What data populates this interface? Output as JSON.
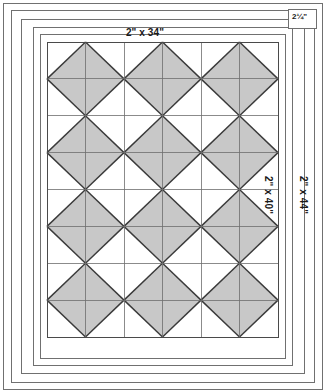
{
  "diagram": {
    "type": "quilt-block-layout",
    "canvas": {
      "width": 325,
      "height": 392
    },
    "colors": {
      "background": "#ffffff",
      "triangle_fill": "#c8c8c8",
      "triangle_stroke": "#3a3a3a",
      "grid_line": "#6e6e6e",
      "border_line": "#707070",
      "outer_frame": "#555555",
      "label_text": "#1a1a1a"
    },
    "labels": {
      "top_border": "2\" x 34\"",
      "inner_right_border": "2\" x 40\"",
      "outer_right_border": "2\" x 44\"",
      "corner_measure": "2¼\""
    },
    "grid": {
      "columns": 6,
      "rows": 8,
      "x": 47,
      "y": 42,
      "width": 231,
      "height": 295,
      "cell_width": 38.5,
      "cell_height": 36.875,
      "unit": "half-square-triangle",
      "block_motif": "chevron-arrow-pointing-left",
      "block_size": 2
    },
    "frames": [
      {
        "name": "outer-frame",
        "x": 3,
        "y": 3,
        "width": 319,
        "height": 386
      },
      {
        "name": "outer-border-strip",
        "x": 11,
        "y": 10,
        "width": 303,
        "height": 372
      },
      {
        "name": "middle-border-strip",
        "x": 21,
        "y": 19,
        "width": 283,
        "height": 354
      },
      {
        "name": "inner-border-strip",
        "x": 33,
        "y": 27,
        "width": 259,
        "height": 338
      },
      {
        "name": "quilt-top-edge",
        "x": 40,
        "y": 34,
        "width": 245,
        "height": 324
      },
      {
        "name": "patchwork-field",
        "x": 47,
        "y": 42,
        "width": 231,
        "height": 295
      }
    ],
    "corner_box": {
      "name": "corner-measure-box",
      "x": 288,
      "y": 9,
      "width": 28,
      "height": 19
    }
  }
}
